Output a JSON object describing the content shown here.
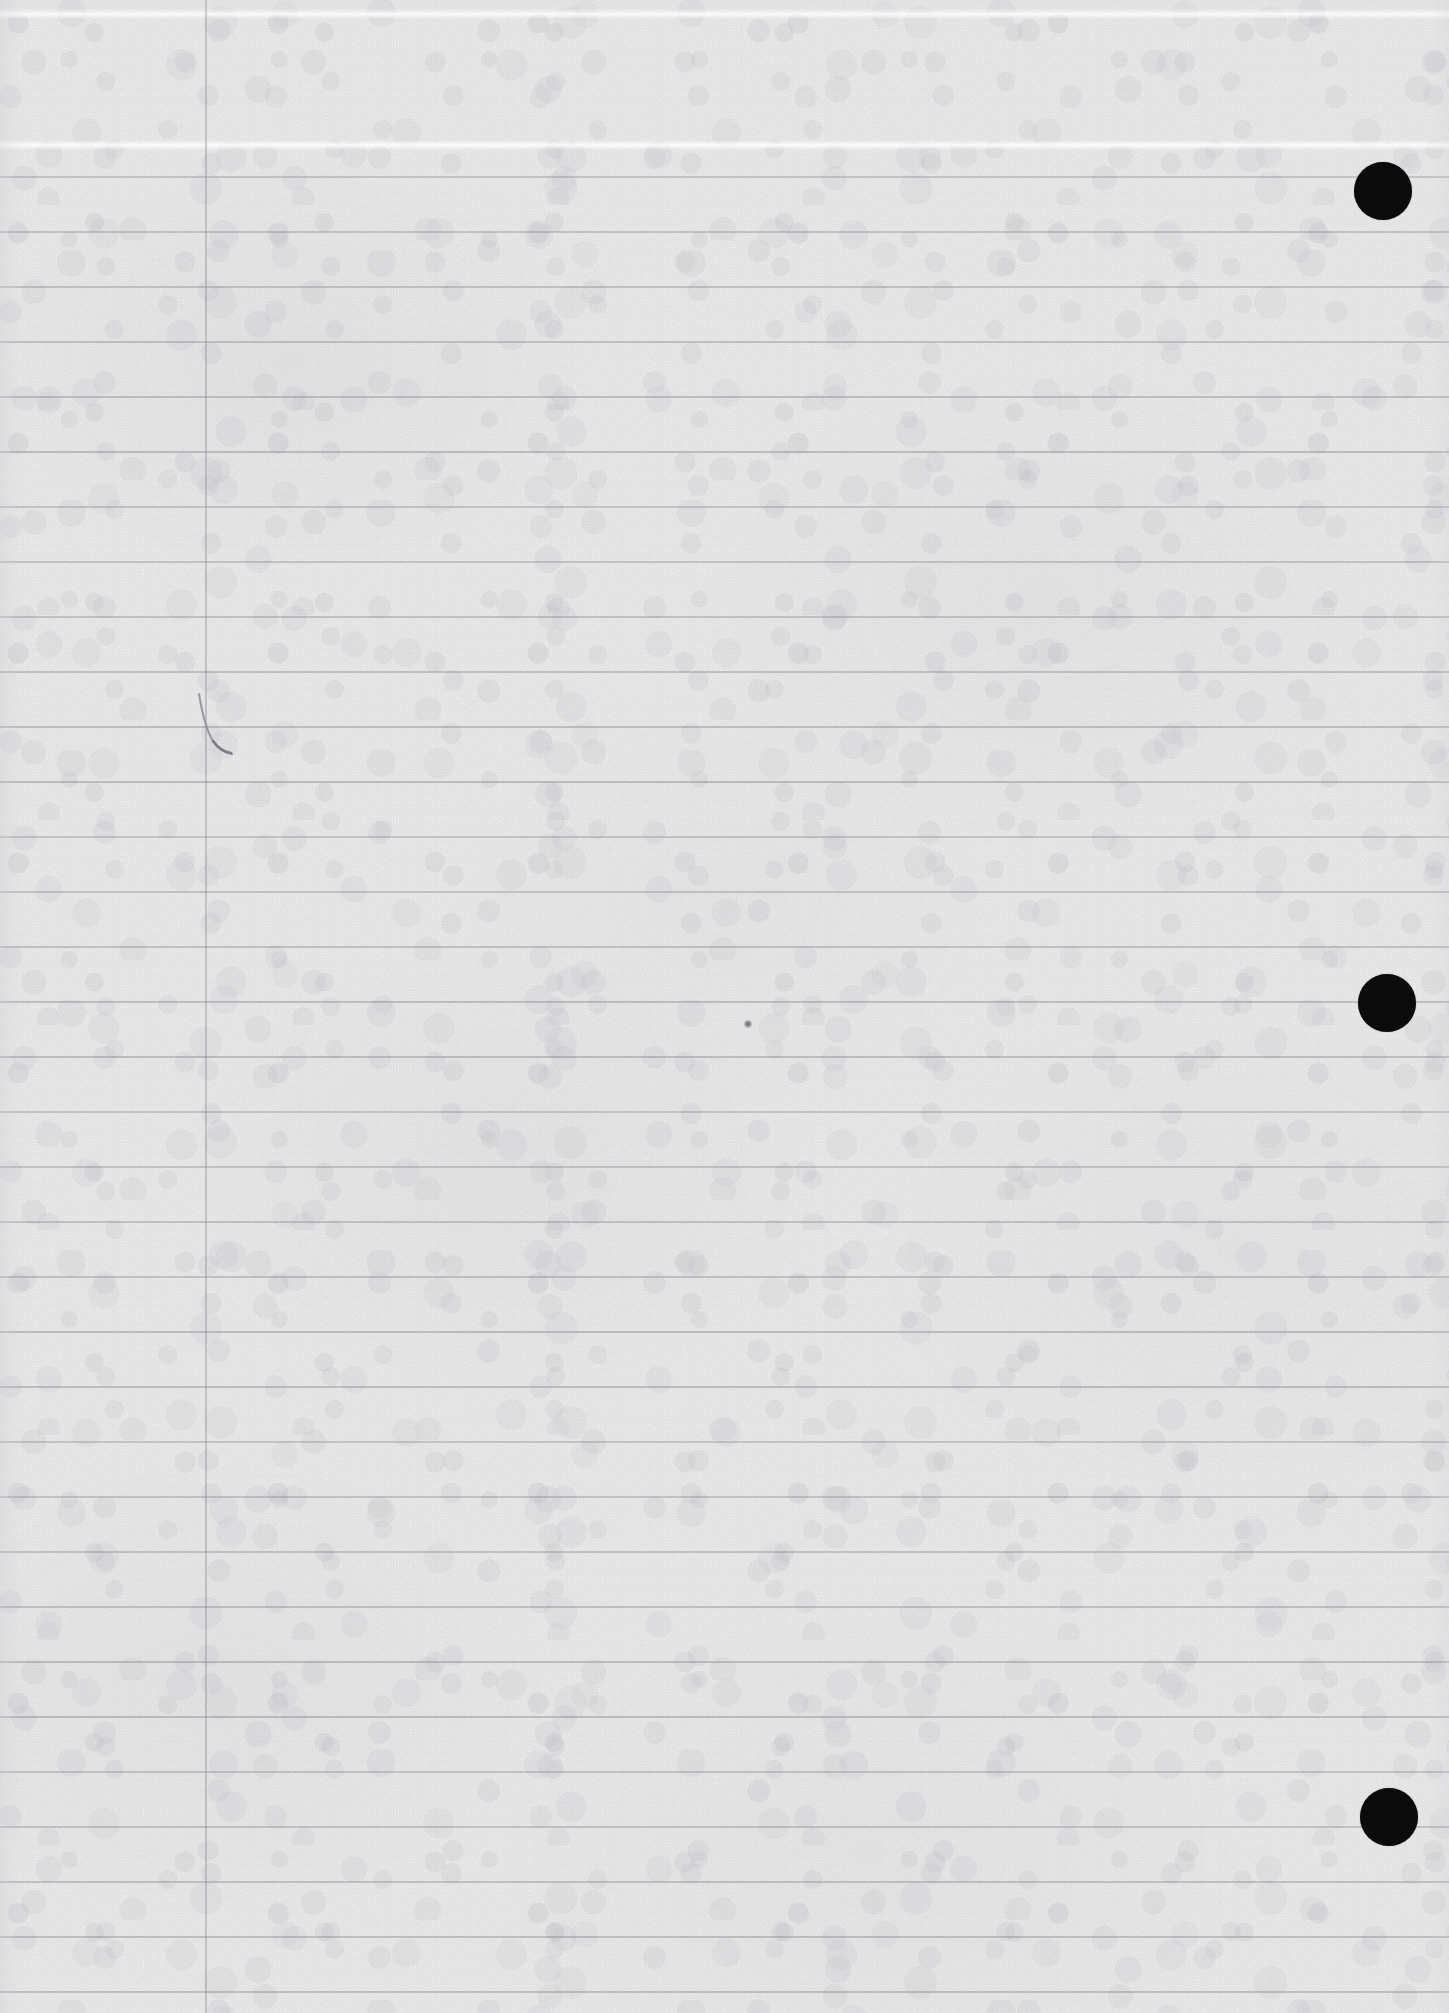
{
  "document": {
    "kind": "scanned-lined-notebook-page",
    "title": "Blank ruled notebook page (scan)",
    "page_width": 1449,
    "page_height": 2013,
    "paper_color": "#f1f1f1",
    "rule_color": "#7c7c82",
    "margin_rule_color": "#82828a",
    "mark_color": "#0b0b0b",
    "content_text": ""
  },
  "ruling": {
    "style": "wide-ruled horizontal lines with single vertical left margin",
    "line_spacing_px": 55,
    "first_line_y": 177,
    "line_count": 34,
    "line_y_positions": [
      177,
      232,
      287,
      342,
      397,
      452,
      507,
      562,
      617,
      672,
      727,
      782,
      837,
      892,
      947,
      1002,
      1057,
      1112,
      1167,
      1222,
      1277,
      1332,
      1387,
      1442,
      1497,
      1552,
      1607,
      1662,
      1717,
      1772,
      1827,
      1882,
      1937,
      1992
    ],
    "margin_line_x": 205,
    "margin_line_top": 0,
    "margin_line_bottom": 2013
  },
  "artifacts": {
    "crease_bands_y": [
      14,
      145
    ],
    "registration_dots": [
      {
        "label": "registration-dot-top",
        "cx": 1383,
        "cy": 191,
        "r": 29
      },
      {
        "label": "registration-dot-middle",
        "cx": 1387,
        "cy": 1003,
        "r": 29
      },
      {
        "label": "registration-dot-bottom",
        "cx": 1389,
        "cy": 1817,
        "r": 29
      }
    ],
    "ink_specks": [
      {
        "label": "ink-speck-center",
        "cx": 748,
        "cy": 1024,
        "r": 4
      }
    ],
    "hair_marks": [
      {
        "label": "hair-mark-margin",
        "x": 185,
        "y": 690,
        "width": 60,
        "height": 70
      }
    ]
  }
}
